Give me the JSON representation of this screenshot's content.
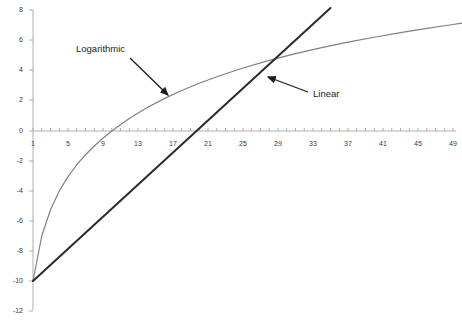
{
  "chart_data": {
    "type": "line",
    "title": "",
    "subtitle": "",
    "xlabel": "",
    "ylabel": "",
    "xlim": [
      1,
      50
    ],
    "ylim": [
      -12,
      8
    ],
    "grid": false,
    "legend_position": "inline-annotations",
    "x_tick_labels": [
      "1",
      "5",
      "9",
      "13",
      "17",
      "21",
      "25",
      "29",
      "33",
      "37",
      "41",
      "45",
      "49"
    ],
    "x_tick_values": [
      1,
      5,
      9,
      13,
      17,
      21,
      25,
      29,
      33,
      37,
      41,
      45,
      49
    ],
    "x_minor_tick_step": 1,
    "y_tick_labels": [
      "8",
      "6",
      "4",
      "2",
      "0",
      "-2",
      "-4",
      "-6",
      "-8",
      "-10",
      "-12"
    ],
    "y_tick_values": [
      8,
      6,
      4,
      2,
      0,
      -2,
      -4,
      -6,
      -8,
      -10,
      -12
    ],
    "series": [
      {
        "name": "Logarithmic",
        "color": "#808080",
        "x": [
          1,
          2,
          3,
          4,
          5,
          6,
          7,
          8,
          9,
          10,
          12,
          14,
          16,
          18,
          20,
          22,
          25,
          28,
          31,
          34,
          37,
          40,
          43,
          46,
          49,
          50
        ],
        "values": [
          -10.0,
          -7.0,
          -5.25,
          -4.0,
          -3.04,
          -2.25,
          -1.58,
          -1.0,
          -0.48,
          -0.0,
          0.84,
          1.55,
          2.16,
          2.7,
          3.18,
          3.62,
          4.2,
          4.71,
          5.16,
          5.56,
          5.92,
          6.25,
          6.56,
          6.84,
          7.1,
          7.19
        ]
      },
      {
        "name": "Linear",
        "color": "#2b2b2b",
        "x": [
          1,
          35
        ],
        "values": [
          -10.0,
          8.2
        ]
      }
    ],
    "annotations": [
      {
        "text": "Logarithmic",
        "label_x_px": 76,
        "label_y_px": 44,
        "arrow_from_px": [
          130,
          58
        ],
        "arrow_to_px": [
          168,
          95
        ]
      },
      {
        "text": "Linear",
        "label_x_px": 313,
        "label_y_px": 89,
        "arrow_from_px": [
          308,
          92
        ],
        "arrow_to_px": [
          268,
          77
        ]
      }
    ]
  },
  "axes": {
    "y_axis_name": "value-axis",
    "x_axis_name": "category-axis"
  }
}
